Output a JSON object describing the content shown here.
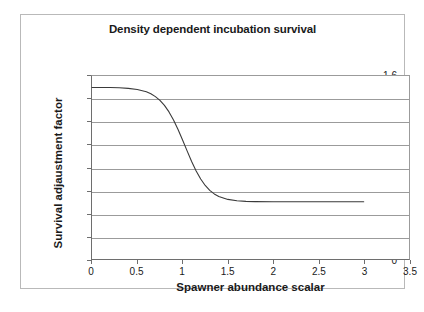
{
  "figure": {
    "title": "Density dependent incubation survival",
    "caption": ""
  },
  "chart_data": {
    "type": "line",
    "title": "Density dependent incubation survival",
    "xlabel": "Spawner abundance scalar",
    "ylabel": "Survival adjaustment factor",
    "xlim": [
      0,
      3.5
    ],
    "ylim": [
      0,
      1.6
    ],
    "grid": "horizontal",
    "legend": "none",
    "xticks": [
      "0",
      "0.5",
      "1",
      "1.5",
      "2",
      "2.5",
      "3",
      "3.5"
    ],
    "xtick_values": [
      0,
      0.5,
      1,
      1.5,
      2,
      2.5,
      3,
      3.5
    ],
    "yticks": [
      "0",
      "0.2",
      "0.4",
      "0.6",
      "0.8",
      "1",
      "1.2",
      "1.4",
      "1.6"
    ],
    "ytick_values": [
      0,
      0.2,
      0.4,
      0.6,
      0.8,
      1,
      1.2,
      1.4,
      1.6
    ],
    "series": [
      {
        "name": "Survival adjustment factor",
        "color": "#3a3a3a",
        "x": [
          0,
          0.1,
          0.2,
          0.3,
          0.4,
          0.5,
          0.6,
          0.65,
          0.7,
          0.75,
          0.8,
          0.85,
          0.9,
          0.95,
          1.0,
          1.05,
          1.1,
          1.15,
          1.2,
          1.25,
          1.3,
          1.35,
          1.4,
          1.5,
          1.6,
          1.7,
          1.8,
          2.0,
          2.2,
          2.5,
          2.8,
          3.0
        ],
        "y": [
          1.5,
          1.5,
          1.499,
          1.497,
          1.492,
          1.482,
          1.462,
          1.445,
          1.42,
          1.387,
          1.343,
          1.286,
          1.215,
          1.132,
          1.04,
          0.945,
          0.853,
          0.77,
          0.699,
          0.643,
          0.6,
          0.569,
          0.547,
          0.521,
          0.509,
          0.504,
          0.502,
          0.5,
          0.5,
          0.5,
          0.5,
          0.5
        ]
      }
    ],
    "annotations": {
      "asymptote_high": 1.5,
      "asymptote_low": 0.5,
      "inflection_x": 1.0,
      "curve_end_x": 3.0
    }
  }
}
